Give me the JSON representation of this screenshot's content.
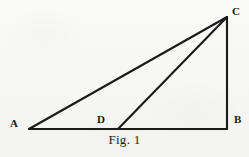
{
  "figure": {
    "caption": "Fig. 1",
    "background_color": "#f7f7f6",
    "ink_color": "#1a1a1a",
    "width": 249,
    "height": 157
  },
  "diagram": {
    "type": "geometry-line-drawing",
    "shape": "right triangle with cevian",
    "stroke_color": "#1a1a1a",
    "stroke_width": 2.1,
    "points": [
      {
        "id": "A",
        "label": "A",
        "x": 29,
        "y": 129,
        "role": "vertex",
        "position": "bottom-left"
      },
      {
        "id": "D",
        "label": "D",
        "x": 118,
        "y": 129,
        "role": "point-on-segment",
        "position": "on-base-AB"
      },
      {
        "id": "B",
        "label": "B",
        "x": 227,
        "y": 129,
        "role": "vertex",
        "position": "bottom-right"
      },
      {
        "id": "C",
        "label": "C",
        "x": 227,
        "y": 17,
        "role": "vertex",
        "position": "top-right"
      }
    ],
    "segments": [
      {
        "id": "AB",
        "from": "A",
        "to": "B",
        "name": "base"
      },
      {
        "id": "BC",
        "from": "B",
        "to": "C",
        "name": "vertical-leg"
      },
      {
        "id": "AC",
        "from": "A",
        "to": "C",
        "name": "hypotenuse"
      },
      {
        "id": "DC",
        "from": "D",
        "to": "C",
        "name": "cevian"
      }
    ],
    "labels": {
      "A": "A",
      "B": "B",
      "C": "C",
      "D": "D"
    }
  }
}
